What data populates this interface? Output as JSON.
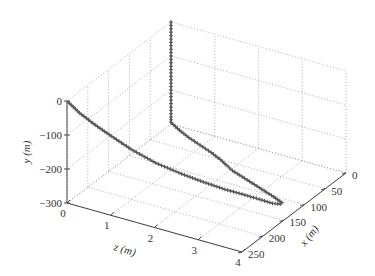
{
  "chart_data": {
    "type": "line3d",
    "title": "",
    "xlabel": "x (m)",
    "ylabel": "y (m)",
    "zlabel": "z (m)",
    "xlim": [
      0,
      250
    ],
    "ylim": [
      -300,
      0
    ],
    "zlim": [
      0,
      4
    ],
    "x_ticks": [
      "0",
      "50",
      "100",
      "150",
      "200",
      "250"
    ],
    "y_ticks": [
      "0",
      "−100",
      "−200",
      "−300"
    ],
    "z_ticks": [
      "0",
      "1",
      "2",
      "3",
      "4"
    ],
    "grid": true,
    "marker": "+",
    "series": [
      {
        "name": "trajectory",
        "color": "#555555",
        "points": [
          [
            0,
            0,
            0
          ],
          [
            0,
            -20,
            0
          ],
          [
            0,
            -40,
            0
          ],
          [
            0,
            -60,
            0
          ],
          [
            0,
            -80,
            0
          ],
          [
            0,
            -100,
            0
          ],
          [
            0,
            -120,
            0
          ],
          [
            0,
            -140,
            0
          ],
          [
            0,
            -160,
            0
          ],
          [
            0,
            -180,
            0
          ],
          [
            0,
            -200,
            0
          ],
          [
            0,
            -220,
            0
          ],
          [
            0,
            -240,
            0
          ],
          [
            0,
            -260,
            0
          ],
          [
            0,
            -280,
            0
          ],
          [
            0,
            -295,
            0
          ],
          [
            5,
            -298,
            0.15
          ],
          [
            12,
            -299,
            0.35
          ],
          [
            20,
            -300,
            0.6
          ],
          [
            30,
            -300,
            0.95
          ],
          [
            40,
            -300,
            1.3
          ],
          [
            50,
            -300,
            1.6
          ],
          [
            60,
            -300,
            1.85
          ],
          [
            68,
            -300,
            2.05
          ],
          [
            76,
            -300,
            2.35
          ],
          [
            84,
            -300,
            2.65
          ],
          [
            92,
            -300,
            2.95
          ],
          [
            100,
            -300,
            3.25
          ],
          [
            106,
            -300,
            3.45
          ],
          [
            110,
            -300,
            3.58
          ],
          [
            116,
            -298,
            3.6
          ],
          [
            124,
            -292,
            3.5
          ],
          [
            135,
            -277,
            3.3
          ],
          [
            150,
            -257,
            3.05
          ],
          [
            165,
            -238,
            2.8
          ],
          [
            180,
            -215,
            2.45
          ],
          [
            195,
            -190,
            2.1
          ],
          [
            210,
            -160,
            1.65
          ],
          [
            222,
            -125,
            1.2
          ],
          [
            232,
            -90,
            0.85
          ],
          [
            240,
            -60,
            0.55
          ],
          [
            246,
            -30,
            0.25
          ],
          [
            250,
            0,
            0
          ]
        ]
      }
    ]
  }
}
